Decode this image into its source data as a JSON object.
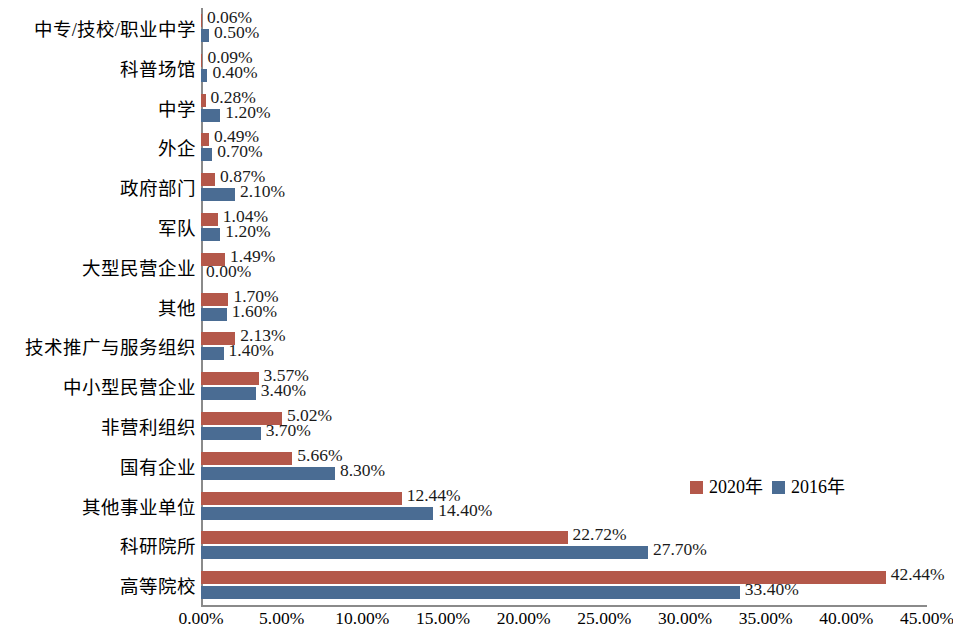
{
  "chart_data": {
    "type": "bar",
    "orientation": "horizontal",
    "title": "",
    "xlabel": "",
    "ylabel": "",
    "xlim": [
      0,
      45
    ],
    "xticks": [
      "0.00%",
      "5.00%",
      "10.00%",
      "15.00%",
      "20.00%",
      "25.00%",
      "30.00%",
      "35.00%",
      "40.00%",
      "45.00%"
    ],
    "grid": false,
    "legend_position": "middle-right",
    "categories": [
      "中专/技校/职业中学",
      "科普场馆",
      "中学",
      "外企",
      "政府部门",
      "军队",
      "大型民营企业",
      "其他",
      "技术推广与服务组织",
      "中小型民营企业",
      "非营利组织",
      "国有企业",
      "其他事业单位",
      "科研院所",
      "高等院校"
    ],
    "series": [
      {
        "name": "2020年",
        "color": "#b4584a",
        "values": [
          0.06,
          0.09,
          0.28,
          0.49,
          0.87,
          1.04,
          1.49,
          1.7,
          2.13,
          3.57,
          5.02,
          5.66,
          12.44,
          22.72,
          42.44
        ],
        "labels": [
          "0.06%",
          "0.09%",
          "0.28%",
          "0.49%",
          "0.87%",
          "1.04%",
          "1.49%",
          "1.70%",
          "2.13%",
          "3.57%",
          "5.02%",
          "5.66%",
          "12.44%",
          "22.72%",
          "42.44%"
        ]
      },
      {
        "name": "2016年",
        "color": "#4a6c93",
        "values": [
          0.5,
          0.4,
          1.2,
          0.7,
          2.1,
          1.2,
          0.0,
          1.6,
          1.4,
          3.4,
          3.7,
          8.3,
          14.4,
          27.7,
          33.4
        ],
        "labels": [
          "0.50%",
          "0.40%",
          "1.20%",
          "0.70%",
          "2.10%",
          "1.20%",
          "0.00%",
          "1.60%",
          "1.40%",
          "3.40%",
          "3.70%",
          "8.30%",
          "14.40%",
          "27.70%",
          "33.40%"
        ]
      }
    ]
  },
  "legend": {
    "items": [
      {
        "label": "2020年",
        "color": "#b4584a"
      },
      {
        "label": "2016年",
        "color": "#4a6c93"
      }
    ]
  }
}
